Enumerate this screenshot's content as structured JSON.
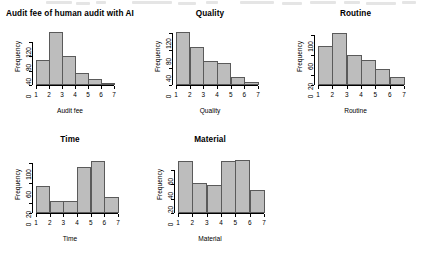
{
  "figure": {
    "background": "#ffffff",
    "bar_fill": "#bdbdbd",
    "bar_border": "#5a5a5a",
    "layout": "2x3 grid, 5 histogram panels, bottom-right cell empty"
  },
  "chart_data": [
    {
      "type": "bar",
      "title": "Audit fee of human audit with AI",
      "xlabel": "Audit fee",
      "ylabel": "Frequency",
      "categories": [
        "1",
        "2",
        "3",
        "4",
        "5",
        "6",
        "7"
      ],
      "bin_edges": [
        1,
        2,
        3,
        4,
        5,
        6,
        7
      ],
      "values": [
        70,
        148,
        80,
        32,
        18,
        2
      ],
      "yticks": [
        0,
        40,
        80,
        120
      ],
      "ylim": [
        0,
        155
      ],
      "xticks": [
        1,
        2,
        3,
        4,
        5,
        6,
        7
      ],
      "xlim": [
        1,
        7
      ],
      "grid": false,
      "legend": false
    },
    {
      "type": "bar",
      "title": "Quality",
      "xlabel": "Quality",
      "ylabel": "Frequency",
      "categories": [
        "1",
        "2",
        "3",
        "4",
        "5",
        "6",
        "7"
      ],
      "bin_edges": [
        1,
        2,
        3,
        4,
        5,
        6,
        7
      ],
      "values": [
        121,
        87,
        55,
        50,
        18,
        8
      ],
      "yticks": [
        0,
        40,
        80,
        120
      ],
      "ylim": [
        0,
        128
      ],
      "xticks": [
        1,
        2,
        3,
        4,
        5,
        6,
        7
      ],
      "xlim": [
        1,
        7
      ],
      "grid": false,
      "legend": false
    },
    {
      "type": "bar",
      "title": "Routine",
      "xlabel": "Routine",
      "ylabel": "Frequency",
      "categories": [
        "1",
        "2",
        "3",
        "4",
        "5",
        "6",
        "7"
      ],
      "bin_edges": [
        1,
        2,
        3,
        4,
        5,
        6,
        7
      ],
      "values": [
        79,
        105,
        61,
        51,
        33,
        16
      ],
      "yticks": [
        0,
        20,
        60,
        100
      ],
      "ylim": [
        0,
        112
      ],
      "xticks": [
        1,
        2,
        3,
        4,
        5,
        6,
        7
      ],
      "xlim": [
        1,
        7
      ],
      "grid": false,
      "legend": false
    },
    {
      "type": "bar",
      "title": "Time",
      "xlabel": "Time",
      "ylabel": "Frequency",
      "categories": [
        "1",
        "2",
        "3",
        "4",
        "5",
        "6",
        "7"
      ],
      "bin_edges": [
        1,
        2,
        3,
        4,
        5,
        6,
        7
      ],
      "values": [
        55,
        25,
        24,
        92,
        105,
        33
      ],
      "yticks": [
        0,
        20,
        60,
        100
      ],
      "ylim": [
        0,
        112
      ],
      "xticks": [
        1,
        2,
        3,
        4,
        5,
        6,
        7
      ],
      "xlim": [
        1,
        7
      ],
      "grid": false,
      "legend": false
    },
    {
      "type": "bar",
      "title": "Material",
      "xlabel": "Material",
      "ylabel": "Frequency",
      "categories": [
        "1",
        "2",
        "3",
        "4",
        "5",
        "6",
        "7"
      ],
      "bin_edges": [
        1,
        2,
        3,
        4,
        5,
        6,
        7
      ],
      "values": [
        72,
        42,
        39,
        72,
        74,
        32
      ],
      "yticks": [
        0,
        20,
        40,
        60
      ],
      "ylim": [
        0,
        78
      ],
      "xticks": [
        1,
        2,
        3,
        4,
        5,
        6,
        7
      ],
      "xlim": [
        1,
        7
      ],
      "grid": false,
      "legend": false
    }
  ]
}
